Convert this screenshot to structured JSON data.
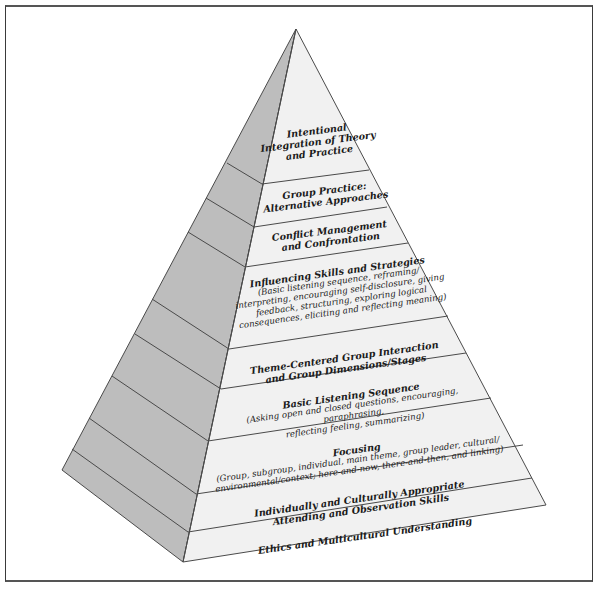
{
  "diagram": {
    "type": "pyramid",
    "colors": {
      "front_face": "#f1f1f1",
      "left_face": "#bdbdbd",
      "edge": "#4a4a4a",
      "frame": "#3a3a3a"
    },
    "levels": [
      {
        "title": "Intentional\nIntegration of Theory\nand Practice",
        "detail": ""
      },
      {
        "title": "Group Practice:\nAlternative Approaches",
        "detail": ""
      },
      {
        "title": "Conflict Management\nand Confrontation",
        "detail": ""
      },
      {
        "title": "Influencing Skills and Strategies",
        "detail": "(Basic listening sequence, reframing/\ninterpreting, encouraging self-disclosure, giving\nfeedback, structuring, exploring logical\nconsequences, eliciting and reflecting meaning)"
      },
      {
        "title": "Theme-Centered Group Interaction\nand Group Dimensions/Stages",
        "detail": ""
      },
      {
        "title": "Basic Listening Sequence",
        "detail": "(Asking open and closed questions, encouraging, paraphrasing,\nreflecting feeling, summarizing)"
      },
      {
        "title": "Focusing",
        "detail": "(Group, subgroup, individual, main theme, group leader, cultural/\nenvironmental/context; here-and-now, there-and-then, and linking)"
      },
      {
        "title": "Individually and Culturally Appropriate\nAttending and Observation Skills",
        "detail": ""
      },
      {
        "title": "Ethics and Multicultural Understanding",
        "detail": ""
      }
    ]
  }
}
